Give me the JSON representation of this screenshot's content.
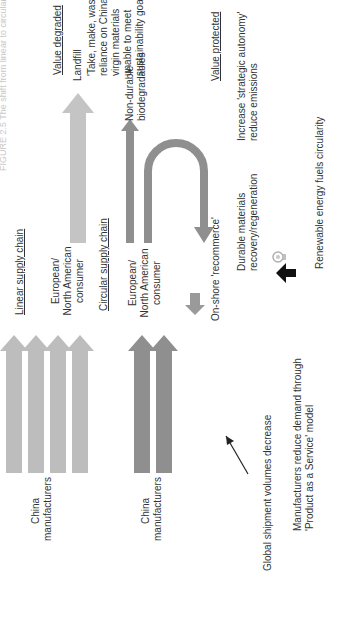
{
  "figure": {
    "title": "FIGURE 2.5  The shift from linear to circular supply chains"
  },
  "linear": {
    "heading": "Linear supply chain",
    "source_label_line1": "China",
    "source_label_line2": "manufacturers",
    "consumer_line1": "European/",
    "consumer_line2": "North American",
    "consumer_line3": "consumer",
    "destination": "Landfill",
    "value_heading": "Value degraded",
    "value_desc_line1": "'Take, make, waste'",
    "value_desc_line2": "reliance on China for",
    "value_desc_line3": "virgin materials",
    "value_desc_line4": "unable to meet",
    "value_desc_line5": "sustainability goals",
    "arrow_count": 4,
    "arrow_color": "#b9b9b9"
  },
  "circular": {
    "heading": "Circular supply chain",
    "source_label_line1": "China",
    "source_label_line2": "manufacturers",
    "consumer_line1": "European/",
    "consumer_line2": "North American",
    "consumer_line3": "consumer",
    "destination_line1": "Non-durable",
    "destination_line2": "biodegradables",
    "recommerce": "On-shore 'recommerce'",
    "durable_line1": "Durable materials",
    "durable_line2": "recovery/regeneration",
    "value_heading": "Value protected",
    "value_desc_line1": "Increase 'strategic autonomy'",
    "value_desc_line2": "reduce emissions",
    "arrow_count": 2,
    "arrow_color": "#8e8e8e"
  },
  "annotations": {
    "shipments": "Global shipment volumes decrease",
    "paas_line1": "Manufacturers reduce demand through",
    "paas_line2": "'Product as a Service' model",
    "renewable": "Renewable energy fuels circularity"
  },
  "icons": {
    "bulb": "lightbulb-icon",
    "pointer": "arrow-icon"
  }
}
